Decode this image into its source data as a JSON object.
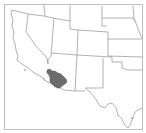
{
  "map": {
    "title": "Locator map",
    "region_shown": "Southwestern United States",
    "highlighted_region": "Southern Arizona region",
    "colors": {
      "background": "#ffffff",
      "frame": "#bdbdbd",
      "state_borders": "#8f8f8f",
      "highlight_fill": "#6b6b6b"
    },
    "states_visible": [
      "California",
      "Nevada",
      "Oregon",
      "Idaho",
      "Utah",
      "Arizona",
      "Wyoming",
      "Colorado",
      "New Mexico",
      "Nebraska",
      "Kansas",
      "Oklahoma",
      "Texas"
    ]
  }
}
